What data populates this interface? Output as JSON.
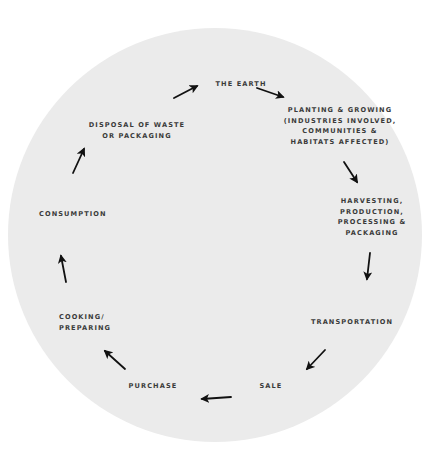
{
  "diagram": {
    "type": "cycle",
    "background_color": "#ffffff",
    "circle_color": "#ebebeb",
    "text_color": "#3a3a3a",
    "arrow_color": "#111111",
    "stages": [
      {
        "id": "the-earth",
        "label": "THE EARTH"
      },
      {
        "id": "planting-growing",
        "label": "PLANTING & GROWING\n(INDUSTRIES INVOLVED,\nCOMMUNITIES &\nHABITATS AFFECTED)"
      },
      {
        "id": "harvesting",
        "label": "HARVESTING,\nPRODUCTION,\nPROCESSING &\nPACKAGING"
      },
      {
        "id": "transportation",
        "label": "TRANSPORTATION"
      },
      {
        "id": "sale",
        "label": "SALE"
      },
      {
        "id": "purchase",
        "label": "PURCHASE"
      },
      {
        "id": "cooking-preparing",
        "label": "COOKING/\nPREPARING"
      },
      {
        "id": "consumption",
        "label": "CONSUMPTION"
      },
      {
        "id": "disposal",
        "label": "DISPOSAL OF WASTE\nOR PACKAGING"
      }
    ],
    "arrows": [
      {
        "from": "disposal",
        "to": "the-earth"
      },
      {
        "from": "the-earth",
        "to": "planting-growing"
      },
      {
        "from": "planting-growing",
        "to": "harvesting"
      },
      {
        "from": "harvesting",
        "to": "transportation"
      },
      {
        "from": "transportation",
        "to": "sale"
      },
      {
        "from": "sale",
        "to": "purchase"
      },
      {
        "from": "purchase",
        "to": "cooking-preparing"
      },
      {
        "from": "cooking-preparing",
        "to": "consumption"
      },
      {
        "from": "consumption",
        "to": "disposal"
      }
    ]
  }
}
